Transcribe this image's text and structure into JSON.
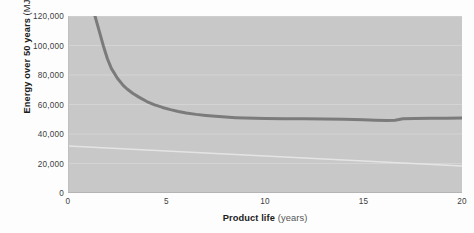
{
  "chart_data": {
    "type": "line",
    "title": "",
    "xlabel": "Product life (years)",
    "xlabel_bold": "Product life",
    "xlabel_unit": " (years)",
    "ylabel": "Energy over 50 years (MJ)",
    "ylabel_bold": "Energy over 50 years",
    "ylabel_unit": " (MJ)",
    "xlim": [
      0,
      20
    ],
    "ylim": [
      0,
      120000
    ],
    "xticks": [
      0,
      5,
      10,
      15,
      20
    ],
    "xtick_labels": [
      "0",
      "5",
      "10",
      "15",
      "20"
    ],
    "yticks": [
      0,
      20000,
      40000,
      60000,
      80000,
      100000,
      120000
    ],
    "ytick_labels": [
      "0",
      "20,000",
      "40,000",
      "60,000",
      "80,000",
      "100,000",
      "120,000"
    ],
    "grid": true,
    "grid_axis": "y",
    "legend": false,
    "legend_position": "none",
    "series": [
      {
        "name": "Energy over 50 years",
        "color": "#7b7b7b",
        "line_width": 3,
        "x": [
          1.37,
          1.6,
          1.8,
          2.0,
          2.2,
          2.5,
          2.8,
          3.0,
          3.3,
          3.6,
          4.0,
          4.4,
          4.8,
          5.2,
          5.6,
          6.0,
          6.5,
          7.0,
          7.5,
          8.0,
          8.5,
          9.0,
          9.5,
          10.0,
          11.0,
          12.0,
          13.0,
          14.0,
          15.0,
          15.6,
          16.2,
          16.6,
          17.0,
          17.6,
          18.4,
          19.2,
          20.0
        ],
        "y": [
          120000,
          109000,
          99500,
          91000,
          84500,
          78000,
          73000,
          70500,
          67500,
          65000,
          62000,
          59800,
          58000,
          56500,
          55300,
          54300,
          53300,
          52600,
          52000,
          51500,
          51100,
          50800,
          50600,
          50500,
          50400,
          50300,
          50200,
          50000,
          49700,
          49400,
          49200,
          49300,
          50300,
          50500,
          50600,
          50700,
          50800
        ]
      }
    ],
    "artifacts": {
      "scan_line_description": "faint diagonal white scan line crossing lower plot",
      "scan_line_x": [
        0,
        394
      ],
      "scan_line_y": [
        130,
        150
      ]
    },
    "colors": {
      "plot_background": "#c8c8c8",
      "curve": "#7b7b7b",
      "gridline": "#d4d4d4",
      "page_background": "#fdfdfd",
      "axis_text": "#3d3d3d",
      "axis_title": "#1c1c1c"
    }
  }
}
